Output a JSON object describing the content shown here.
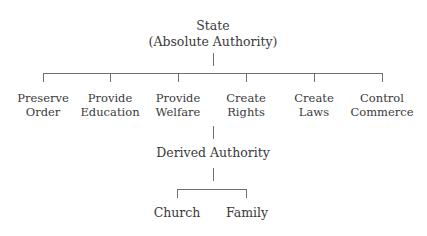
{
  "diagram": {
    "root": {
      "line1": "State",
      "line2": "(Absolute Authority)"
    },
    "functions": [
      {
        "line1": "Preserve",
        "line2": "Order"
      },
      {
        "line1": "Provide",
        "line2": "Education"
      },
      {
        "line1": "Provide",
        "line2": "Welfare"
      },
      {
        "line1": "Create",
        "line2": "Rights"
      },
      {
        "line1": "Create",
        "line2": "Laws"
      },
      {
        "line1": "Control",
        "line2": "Commerce"
      }
    ],
    "derived": {
      "label": "Derived Authority"
    },
    "children": [
      {
        "label": "Church"
      },
      {
        "label": "Family"
      }
    ],
    "colors": {
      "text": "#3a3a3a",
      "lines": "#707070",
      "background": "#ffffff"
    }
  }
}
